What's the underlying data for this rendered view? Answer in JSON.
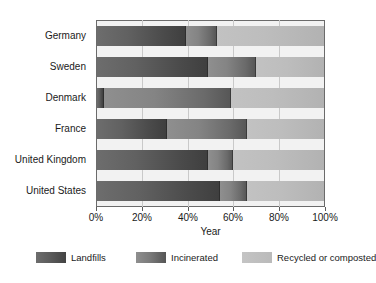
{
  "chart_data": {
    "type": "bar",
    "orientation": "horizontal",
    "stacked": true,
    "title": "",
    "xlabel": "Year",
    "ylabel": "",
    "categories": [
      "Germany",
      "Sweden",
      "Denmark",
      "France",
      "United Kingdom",
      "United States"
    ],
    "series": [
      {
        "name": "Landfills",
        "values": [
          39,
          49,
          3,
          31,
          49,
          54
        ],
        "color": "#4b4b4b"
      },
      {
        "name": "Incinerated",
        "values": [
          14,
          21,
          56,
          35,
          11,
          12
        ],
        "color": "#7b7b7b"
      },
      {
        "name": "Recycled or composted",
        "values": [
          47,
          30,
          41,
          34,
          40,
          34
        ],
        "color": "#bdbdbd"
      }
    ],
    "xlim": [
      0,
      100
    ],
    "xticks": [
      0,
      20,
      40,
      60,
      80,
      100
    ],
    "xticklabels": [
      "0%",
      "20%",
      "40%",
      "60%",
      "80%",
      "100%"
    ],
    "grid": true,
    "legend_position": "bottom"
  },
  "axis": {
    "x_title": "Year"
  },
  "legend": {
    "items": [
      {
        "label": "Landfills"
      },
      {
        "label": "Incinerated"
      },
      {
        "label": "Recycled or composted"
      }
    ]
  }
}
